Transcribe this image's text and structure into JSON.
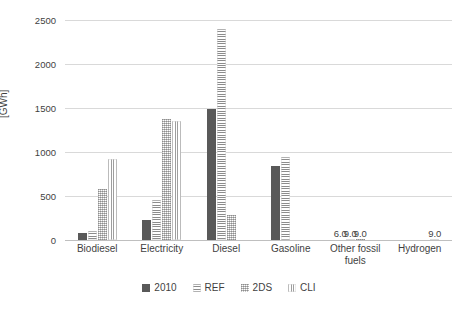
{
  "chart_data": {
    "type": "bar",
    "title": "",
    "xlabel": "",
    "ylabel": "[GWh]",
    "ylim": [
      0,
      2500
    ],
    "yticks": [
      0,
      500,
      1000,
      1500,
      2000,
      2500
    ],
    "ytick_labels": [
      "0",
      "500",
      "1000",
      "1500",
      "2000",
      "2500"
    ],
    "grid": true,
    "legend_position": "bottom",
    "categories": [
      "Biodiesel",
      "Electricity",
      "Diesel",
      "Gasoline",
      "Other fossil fuels",
      "Hydrogen"
    ],
    "series": [
      {
        "name": "2010",
        "color": "#595959",
        "pattern": "solid",
        "values": [
          75,
          230,
          1490,
          840,
          6.0,
          0
        ],
        "labels": [
          "",
          "",
          "",
          "",
          "6.0",
          ""
        ]
      },
      {
        "name": "REF",
        "color": "#8c8c8c",
        "pattern": "horizontal-stripes",
        "values": [
          105,
          450,
          2400,
          940,
          9.0,
          0
        ],
        "labels": [
          "",
          "",
          "",
          "",
          "9.0",
          ""
        ]
      },
      {
        "name": "2DS",
        "color": "#c9c9c9",
        "pattern": "dotted-checkered",
        "values": [
          580,
          1380,
          280,
          0,
          9.0,
          0
        ],
        "labels": [
          "",
          "",
          "",
          "",
          "9.0",
          ""
        ]
      },
      {
        "name": "CLI",
        "color": "#9e9e9e",
        "pattern": "vertical-stripes",
        "values": [
          920,
          1350,
          0,
          0,
          0,
          9.0
        ],
        "labels": [
          "",
          "",
          "",
          "",
          "",
          "9.0"
        ]
      }
    ]
  }
}
